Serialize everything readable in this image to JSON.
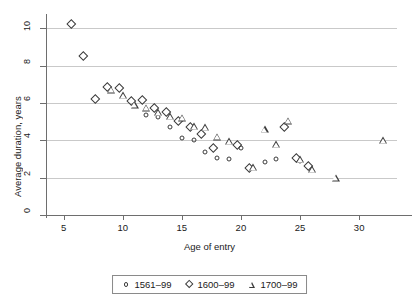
{
  "chart_data": {
    "type": "scatter",
    "title": "",
    "xlabel": "Age of entry",
    "ylabel": "Average duration, years",
    "xlim": [
      3.6,
      33.2
    ],
    "ylim": [
      0,
      10.55
    ],
    "xticks": [
      5,
      10,
      15,
      20,
      25,
      30
    ],
    "yticks": [
      0,
      2,
      4,
      6,
      8,
      10
    ],
    "grid": "horizontal",
    "legend_position": "below-axis-centered",
    "series": [
      {
        "name": "1561–99",
        "marker": "circle",
        "points": [
          {
            "x": 12,
            "y": 5.35
          },
          {
            "x": 13,
            "y": 5.25
          },
          {
            "x": 14,
            "y": 4.7
          },
          {
            "x": 15,
            "y": 4.1
          },
          {
            "x": 16,
            "y": 4.0
          },
          {
            "x": 17,
            "y": 3.4
          },
          {
            "x": 18,
            "y": 3.05
          },
          {
            "x": 19,
            "y": 3.0
          },
          {
            "x": 20,
            "y": 3.6
          },
          {
            "x": 22,
            "y": 2.85
          },
          {
            "x": 23,
            "y": 3.0
          },
          {
            "x": 25,
            "y": 2.9
          }
        ]
      },
      {
        "name": "1600–99",
        "marker": "diamond",
        "points": [
          {
            "x": 6,
            "y": 10.0
          },
          {
            "x": 7,
            "y": 8.3
          },
          {
            "x": 8,
            "y": 6.0
          },
          {
            "x": 9,
            "y": 6.65
          },
          {
            "x": 10,
            "y": 6.6
          },
          {
            "x": 11,
            "y": 5.9
          },
          {
            "x": 12,
            "y": 5.95
          },
          {
            "x": 13,
            "y": 5.5
          },
          {
            "x": 14,
            "y": 5.3
          },
          {
            "x": 15,
            "y": 4.8
          },
          {
            "x": 16,
            "y": 4.5
          },
          {
            "x": 17,
            "y": 4.15
          },
          {
            "x": 18,
            "y": 3.35
          },
          {
            "x": 20,
            "y": 3.55
          },
          {
            "x": 21,
            "y": 2.3
          },
          {
            "x": 24,
            "y": 4.5
          },
          {
            "x": 25,
            "y": 2.85
          },
          {
            "x": 26,
            "y": 2.4
          }
        ]
      },
      {
        "name": "1700–99",
        "marker": "triangle",
        "points": [
          {
            "x": 9,
            "y": 6.7
          },
          {
            "x": 10,
            "y": 6.4
          },
          {
            "x": 11,
            "y": 5.9
          },
          {
            "x": 12,
            "y": 5.75
          },
          {
            "x": 13,
            "y": 5.5
          },
          {
            "x": 14,
            "y": 5.3
          },
          {
            "x": 15,
            "y": 5.2
          },
          {
            "x": 16,
            "y": 4.75
          },
          {
            "x": 17,
            "y": 4.7
          },
          {
            "x": 18,
            "y": 4.2
          },
          {
            "x": 19,
            "y": 3.95
          },
          {
            "x": 21,
            "y": 2.55
          },
          {
            "x": 22,
            "y": 4.6
          },
          {
            "x": 23,
            "y": 3.8
          },
          {
            "x": 24,
            "y": 5.05
          },
          {
            "x": 25,
            "y": 3.0
          },
          {
            "x": 26,
            "y": 2.45
          },
          {
            "x": 28,
            "y": 2.0
          },
          {
            "x": 32,
            "y": 4.0
          }
        ]
      }
    ]
  },
  "legend": {
    "items": [
      {
        "label": "1561–99",
        "marker": "circle"
      },
      {
        "label": "1600–99",
        "marker": "diamond"
      },
      {
        "label": "1700–99",
        "marker": "triangle"
      }
    ]
  },
  "colors": {
    "marker_stroke": "#3b3b3b",
    "gridline": "#c9c9c9",
    "axis": "#6e6e6e",
    "background": "#ffffff"
  }
}
